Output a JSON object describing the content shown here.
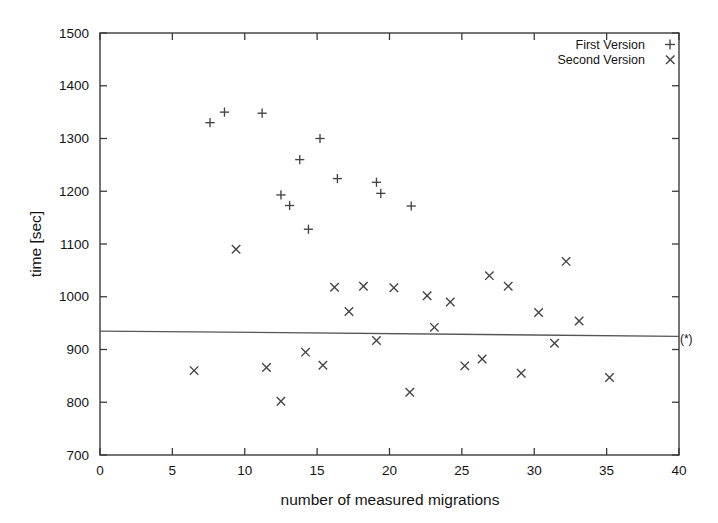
{
  "chart_data": {
    "type": "scatter",
    "title": "",
    "xlabel": "number of measured migrations",
    "ylabel": "time [sec]",
    "xlim": [
      0,
      40
    ],
    "ylim": [
      700,
      1500
    ],
    "xticks": [
      0,
      5,
      10,
      15,
      20,
      25,
      30,
      35,
      40
    ],
    "yticks": [
      700,
      800,
      900,
      1000,
      1100,
      1200,
      1300,
      1400,
      1500
    ],
    "xtick_labels": [
      "0",
      "5",
      "10",
      "15",
      "20",
      "25",
      "30",
      "35",
      "40"
    ],
    "ytick_labels": [
      "700",
      "800",
      "900",
      "1000",
      "1100",
      "1200",
      "1300",
      "1400",
      "1500"
    ],
    "grid": false,
    "legend_position": "top-right",
    "series": [
      {
        "name": "First Version",
        "marker": "plus",
        "points": [
          [
            7.6,
            1330
          ],
          [
            8.6,
            1350
          ],
          [
            11.2,
            1348
          ],
          [
            12.5,
            1193
          ],
          [
            13.1,
            1173
          ],
          [
            13.8,
            1260
          ],
          [
            14.4,
            1128
          ],
          [
            15.2,
            1300
          ],
          [
            16.4,
            1224
          ],
          [
            19.1,
            1217
          ],
          [
            19.4,
            1196
          ],
          [
            21.5,
            1172
          ]
        ]
      },
      {
        "name": "Second Version",
        "marker": "cross",
        "points": [
          [
            6.5,
            860
          ],
          [
            9.4,
            1090
          ],
          [
            11.5,
            866
          ],
          [
            12.5,
            802
          ],
          [
            14.2,
            895
          ],
          [
            15.4,
            870
          ],
          [
            16.2,
            1018
          ],
          [
            17.2,
            972
          ],
          [
            18.2,
            1020
          ],
          [
            19.1,
            917
          ],
          [
            20.3,
            1017
          ],
          [
            21.4,
            819
          ],
          [
            22.6,
            1002
          ],
          [
            23.1,
            942
          ],
          [
            24.2,
            990
          ],
          [
            25.2,
            869
          ],
          [
            26.4,
            882
          ],
          [
            26.9,
            1040
          ],
          [
            28.2,
            1020
          ],
          [
            29.1,
            855
          ],
          [
            30.3,
            970
          ],
          [
            31.4,
            912
          ],
          [
            32.2,
            1067
          ],
          [
            33.1,
            954
          ],
          [
            35.2,
            847
          ]
        ]
      }
    ],
    "reference_line": {
      "label": "(*)",
      "y_start": 935,
      "y_end": 925,
      "x_start": 0,
      "x_end": 40
    },
    "annotations": [
      {
        "text": "(*)",
        "x": 40.5,
        "y": 912
      }
    ]
  }
}
